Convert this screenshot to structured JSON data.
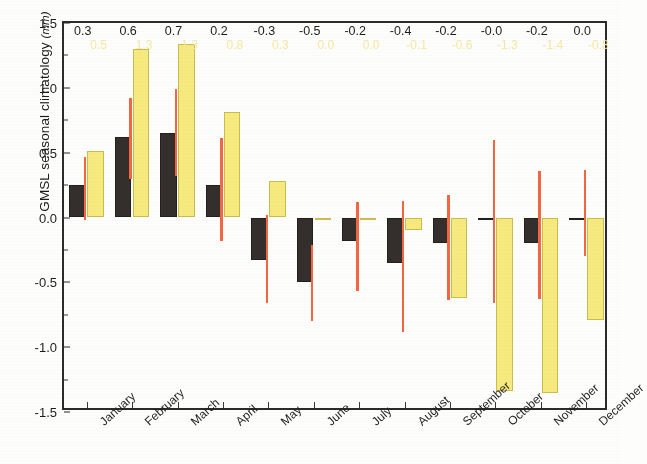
{
  "chart_data": {
    "type": "bar",
    "title": "",
    "xlabel": "",
    "ylabel": "GMSL seasonal climatology (mm)",
    "ylabel_text": "GMSL seasonal climatology",
    "ylabel_unit": "mm",
    "ylim": [
      -1.5,
      1.5
    ],
    "ytick_labels": [
      "1.5",
      "1.0",
      "0.5",
      "0.0",
      "-0.5",
      "-1.0",
      "-1.5"
    ],
    "ytick_values": [
      1.5,
      1.0,
      0.5,
      0.0,
      -0.5,
      -1.0,
      -1.5
    ],
    "grid": false,
    "legend": "none",
    "categories": [
      "January",
      "February",
      "March",
      "April",
      "May",
      "June",
      "July",
      "August",
      "September",
      "October",
      "November",
      "December"
    ],
    "series": [
      {
        "name": "dark",
        "color": "#342f2c",
        "values": [
          0.25,
          0.62,
          0.65,
          0.25,
          -0.33,
          -0.5,
          -0.18,
          -0.35,
          -0.2,
          -0.02,
          -0.2,
          -0.02
        ],
        "labels": [
          "0.3",
          "0.6",
          "0.7",
          "0.2",
          "-0.3",
          "-0.5",
          "-0.2",
          "-0.4",
          "-0.2",
          "-0.0",
          "-0.2",
          "0.0"
        ]
      },
      {
        "name": "light",
        "color": "#f6ea7e",
        "values": [
          0.51,
          1.3,
          1.34,
          0.81,
          0.28,
          -0.01,
          -0.02,
          -0.1,
          -0.62,
          -1.34,
          -1.35,
          -0.79
        ],
        "labels": [
          "0.5",
          "1.3",
          "1.3",
          "0.8",
          "0.3",
          "0.0",
          "0.0",
          "-0.1",
          "-0.6",
          "-1.3",
          "-1.4",
          "-0.8"
        ]
      }
    ],
    "error_bars": {
      "color": "#f4663f",
      "dark_series": [
        {
          "low": -0.02,
          "high": 0.47
        },
        {
          "low": 0.3,
          "high": 0.92
        },
        {
          "low": 0.32,
          "high": 0.99
        },
        {
          "low": -0.18,
          "high": 0.61
        },
        {
          "low": -0.66,
          "high": 0.02
        },
        {
          "low": -0.8,
          "high": -0.21
        },
        {
          "low": -0.57,
          "high": 0.12
        },
        {
          "low": -0.88,
          "high": 0.13
        },
        {
          "low": -0.64,
          "high": 0.17
        },
        {
          "low": -0.66,
          "high": 0.6
        },
        {
          "low": -0.63,
          "high": 0.36
        },
        {
          "low": -0.3,
          "high": 0.37
        }
      ]
    }
  }
}
